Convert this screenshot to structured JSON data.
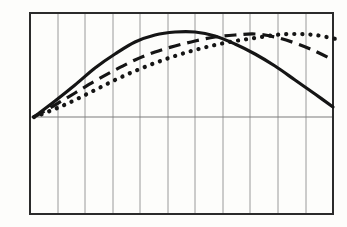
{
  "figure": {
    "background_color": "#fdfdfb"
  },
  "chart_data": {
    "type": "line",
    "title": "",
    "xlabel": "",
    "ylabel": "",
    "y_axis_label": "4",
    "legend": "none",
    "grid": "vertical-only",
    "colors": {
      "ink": "#151515",
      "grid": "#9a9a9a",
      "baseline": "#7d7d7d",
      "frame": "#2b2b2b"
    },
    "frame_px": {
      "left": 30,
      "top": 13,
      "right": 333,
      "bottom": 214
    },
    "baseline_y_px": 117,
    "gridlines_x_px": [
      58,
      85,
      113,
      140,
      168,
      195,
      223,
      250,
      278,
      306
    ],
    "series": [
      {
        "name": "solid-curve",
        "style": "solid",
        "peak_x_px": 185,
        "points_px": [
          [
            34,
            117
          ],
          [
            55,
            101
          ],
          [
            75,
            85
          ],
          [
            95,
            68
          ],
          [
            115,
            54
          ],
          [
            135,
            42
          ],
          [
            155,
            35
          ],
          [
            175,
            32
          ],
          [
            195,
            32
          ],
          [
            215,
            36
          ],
          [
            235,
            44
          ],
          [
            255,
            54
          ],
          [
            275,
            66
          ],
          [
            295,
            80
          ],
          [
            315,
            94
          ],
          [
            333,
            107
          ]
        ]
      },
      {
        "name": "dashed-curve",
        "style": "dashed",
        "peak_x_px": 250,
        "points_px": [
          [
            34,
            117
          ],
          [
            55,
            105
          ],
          [
            75,
            93
          ],
          [
            95,
            81
          ],
          [
            115,
            70
          ],
          [
            135,
            60
          ],
          [
            155,
            52
          ],
          [
            175,
            46
          ],
          [
            195,
            41
          ],
          [
            215,
            37
          ],
          [
            235,
            35
          ],
          [
            255,
            34
          ],
          [
            275,
            37
          ],
          [
            295,
            43
          ],
          [
            315,
            51
          ],
          [
            333,
            60
          ]
        ]
      },
      {
        "name": "dotted-curve",
        "style": "dotted",
        "peak_x_px": 295,
        "points_px": [
          [
            34,
            117
          ],
          [
            55,
            109
          ],
          [
            75,
            100
          ],
          [
            95,
            90
          ],
          [
            115,
            80
          ],
          [
            135,
            71
          ],
          [
            155,
            63
          ],
          [
            175,
            56
          ],
          [
            195,
            50
          ],
          [
            215,
            45
          ],
          [
            235,
            41
          ],
          [
            255,
            38
          ],
          [
            275,
            35
          ],
          [
            295,
            34
          ],
          [
            315,
            35
          ],
          [
            336,
            39
          ]
        ]
      }
    ]
  }
}
